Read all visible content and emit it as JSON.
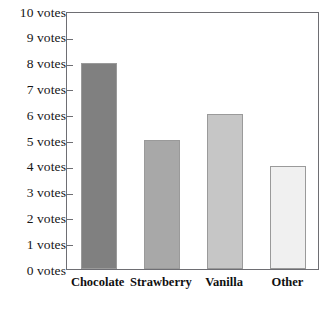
{
  "chart_data": {
    "type": "bar",
    "title": "",
    "xlabel": "",
    "ylabel": "",
    "categories": [
      "Chocolate",
      "Strawberry",
      "Vanilla",
      "Other"
    ],
    "values": [
      8,
      5,
      6,
      4
    ],
    "bar_colors": [
      "#808080",
      "#a8a8a8",
      "#c6c6c6",
      "#f0f0f0"
    ],
    "bar_outline_color": "#9a9a9a",
    "ylim": [
      0,
      10
    ],
    "ytick_values": [
      0,
      1,
      2,
      3,
      4,
      5,
      6,
      7,
      8,
      9,
      10
    ],
    "ytick_labels": [
      "10 votes",
      "9 votes",
      "8 votes",
      "7 votes",
      "6 votes",
      "5 votes",
      "4 votes",
      "3 votes",
      "2 votes",
      "1 votes",
      "0 votes"
    ],
    "grid": false,
    "legend": false,
    "axis_color": "#6e6e73",
    "background": "#ffffff"
  }
}
